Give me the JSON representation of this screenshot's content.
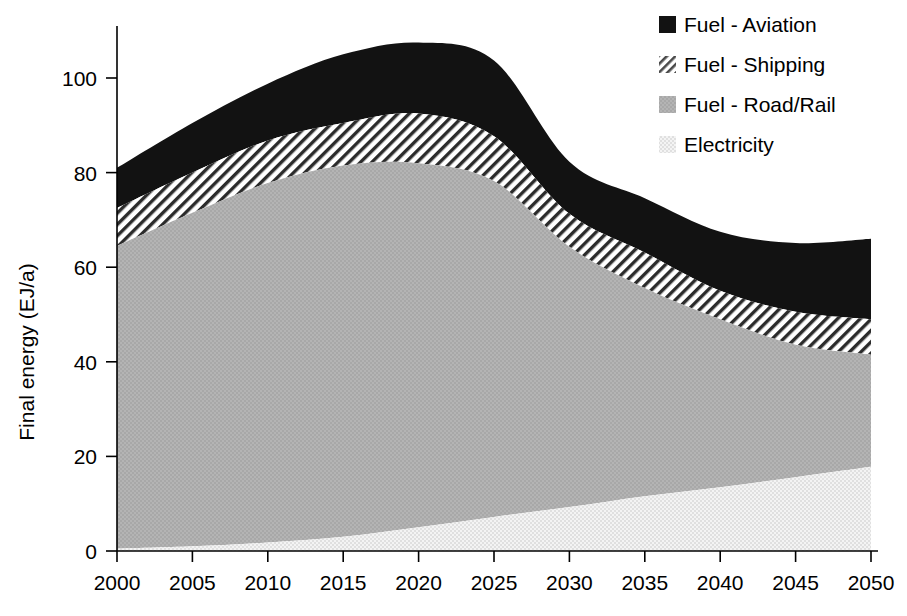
{
  "chart_data": {
    "type": "area",
    "stacked": true,
    "title": "",
    "xlabel": "",
    "ylabel": "Final energy (EJ/a)",
    "xlim": [
      2000,
      2050
    ],
    "ylim": [
      0,
      110
    ],
    "xticks": [
      2000,
      2005,
      2010,
      2015,
      2020,
      2025,
      2030,
      2035,
      2040,
      2045,
      2050
    ],
    "yticks": [
      0,
      20,
      40,
      60,
      80,
      100
    ],
    "grid": false,
    "legend_position": "top-right",
    "x": [
      2000,
      2005,
      2010,
      2015,
      2020,
      2025,
      2030,
      2035,
      2040,
      2045,
      2050
    ],
    "series": [
      {
        "name": "Electricity",
        "fill": "light-dotted",
        "color": "#e9e9e9",
        "values": [
          0.5,
          1.0,
          1.8,
          3.0,
          5.0,
          7.2,
          9.3,
          11.6,
          13.5,
          15.6,
          17.8
        ]
      },
      {
        "name": "Fuel - Road/Rail",
        "fill": "medium-gray",
        "color": "#b2b2b2",
        "values": [
          64.0,
          70.5,
          76.0,
          78.5,
          77.0,
          71.0,
          55.0,
          44.0,
          35.5,
          28.0,
          23.7
        ]
      },
      {
        "name": "Fuel - Shipping",
        "fill": "diagonal-hatch",
        "color": "#ffffff",
        "values": [
          8.0,
          8.5,
          9.0,
          9.0,
          10.5,
          9.5,
          7.0,
          7.5,
          6.0,
          7.0,
          7.5
        ]
      },
      {
        "name": "Fuel - Aviation",
        "fill": "solid-black",
        "color": "#111111",
        "values": [
          8.5,
          10.5,
          12.0,
          14.5,
          15.0,
          16.0,
          11.0,
          11.5,
          12.5,
          14.5,
          17.0
        ]
      }
    ],
    "cumulative_tops": {
      "electricity": [
        0.5,
        1.0,
        1.8,
        3.0,
        5.0,
        7.2,
        9.3,
        11.6,
        13.5,
        15.6,
        17.8
      ],
      "road_rail": [
        64.5,
        71.5,
        77.8,
        81.5,
        82.0,
        78.2,
        64.3,
        55.6,
        49.0,
        43.6,
        41.5
      ],
      "shipping": [
        72.5,
        80.0,
        86.8,
        90.5,
        92.5,
        87.7,
        71.3,
        63.1,
        55.0,
        50.6,
        49.0
      ],
      "aviation_total": [
        81.0,
        90.5,
        98.8,
        105.0,
        107.5,
        103.7,
        82.3,
        74.6,
        67.5,
        65.1,
        66.0
      ]
    }
  },
  "legend": {
    "items": [
      {
        "label": "Fuel - Aviation",
        "swatch": "solid-black"
      },
      {
        "label": "Fuel - Shipping",
        "swatch": "diagonal-hatch"
      },
      {
        "label": "Fuel - Road/Rail",
        "swatch": "medium-gray"
      },
      {
        "label": "Electricity",
        "swatch": "light-dotted"
      }
    ]
  },
  "axes": {
    "y_title": "Final energy (EJ/a)",
    "y_tick_labels": [
      "0",
      "20",
      "40",
      "60",
      "80",
      "100"
    ],
    "x_tick_labels": [
      "2000",
      "2005",
      "2010",
      "2015",
      "2020",
      "2025",
      "2030",
      "2035",
      "2040",
      "2045",
      "2050"
    ]
  }
}
